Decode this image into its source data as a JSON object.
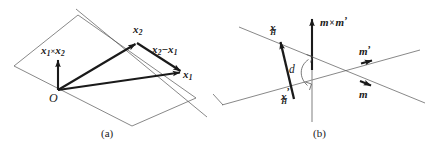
{
  "figure": {
    "background_color": "#ffffff",
    "stroke_color": "#1a1a1a",
    "thin_stroke_color": "#555555",
    "width": 425,
    "height": 149
  },
  "panel_a": {
    "caption": "(a)",
    "origin_label": "O",
    "labels": {
      "cross_product": {
        "base": "x",
        "sub1": "1",
        "operator": "×",
        "base2": "x",
        "sub2": "2"
      },
      "x2": {
        "base": "x",
        "sub": "2"
      },
      "x1": {
        "base": "x",
        "sub": "1"
      },
      "difference": {
        "base1": "x",
        "sub1": "2",
        "operator": "−",
        "base2": "x",
        "sub2": "1"
      }
    },
    "vectors": [
      {
        "name": "x1",
        "from": [
          58,
          90
        ],
        "to": [
          182,
          72
        ]
      },
      {
        "name": "x2",
        "from": [
          58,
          90
        ],
        "to": [
          137,
          43
        ]
      },
      {
        "name": "x1-cross-x2",
        "from": [
          58,
          90
        ],
        "to": [
          58,
          58
        ]
      },
      {
        "name": "x2-minus-x1",
        "from": [
          137,
          43
        ],
        "to": [
          182,
          72
        ]
      }
    ],
    "plane_corners": [
      [
        14,
        66
      ],
      [
        78,
        15
      ],
      [
        196,
        98
      ],
      [
        132,
        126
      ]
    ],
    "diagonal_line": {
      "from": [
        76,
        9
      ],
      "to": [
        207,
        117
      ]
    }
  },
  "panel_b": {
    "caption": "(b)",
    "labels": {
      "x_H": {
        "base": "x",
        "sub": "H"
      },
      "x_H_prime": {
        "base": "x",
        "prime": "’",
        "sub": "H"
      },
      "m_cross_m_prime": {
        "base1": "m",
        "operator": "×",
        "base2": "m",
        "prime": "’"
      },
      "m_prime": {
        "base": "m",
        "prime": "’"
      },
      "m": {
        "base": "m"
      },
      "distance": "d"
    },
    "vertical_axis": {
      "from": [
        312,
        122
      ],
      "to": [
        312,
        16
      ]
    },
    "vector_xh": {
      "from": [
        294,
        99
      ],
      "to": [
        279,
        40
      ]
    },
    "line_m_prime": {
      "from": [
        239,
        27
      ],
      "to": [
        425,
        103
      ]
    },
    "line_m": {
      "from": [
        222,
        105
      ],
      "to": [
        420,
        50
      ]
    },
    "right_angle_upper": [
      312,
      58
    ],
    "right_angle_lower": [
      312,
      86
    ],
    "distance_arc": {
      "top": [
        312,
        58
      ],
      "bottom": [
        312,
        86
      ]
    },
    "arrow_m_prime_at": [
      382,
      61
    ],
    "arrow_m_at": [
      381,
      85
    ]
  }
}
